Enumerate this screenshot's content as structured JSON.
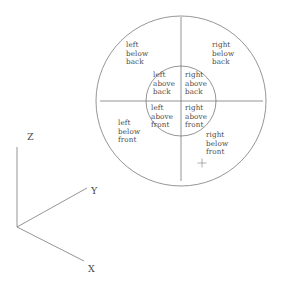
{
  "figure": {
    "background_color": "#ffffff",
    "stroke_color": "#7a7a7a",
    "text_color": "#4a4a4a"
  },
  "geometry": {
    "center_x": 181,
    "center_y": 101,
    "outer_radius": 85,
    "inner_radius": 35,
    "horizontal_axis": {
      "x1": 100,
      "y1": 101,
      "x2": 263,
      "y2": 101
    },
    "vertical_axis": {
      "x1": 181,
      "y1": 17,
      "x2": 181,
      "y2": 181
    },
    "marker_plus": {
      "x": 202,
      "y": 163,
      "size": 9
    }
  },
  "regions": [
    {
      "id": "outer-upper-left",
      "name": "left-below-back",
      "lines": [
        "left",
        "below",
        "back"
      ],
      "x": 126,
      "y": 41
    },
    {
      "id": "outer-upper-right",
      "name": "right-below-back",
      "lines": [
        "right",
        "below",
        "back"
      ],
      "x": 212,
      "y": 41
    },
    {
      "id": "inner-upper-left",
      "name": "left-above-back",
      "lines": [
        "left",
        "above",
        "back"
      ],
      "x": 153,
      "y": 71
    },
    {
      "id": "inner-upper-right",
      "name": "right-above-back",
      "lines": [
        "right",
        "above",
        "back"
      ],
      "x": 185,
      "y": 71
    },
    {
      "id": "inner-lower-left",
      "name": "left-above-front",
      "lines": [
        "left",
        "above",
        "front"
      ],
      "x": 151,
      "y": 104
    },
    {
      "id": "inner-lower-right",
      "name": "right-above-front",
      "lines": [
        "right",
        "above",
        "front"
      ],
      "x": 185,
      "y": 104
    },
    {
      "id": "outer-lower-left",
      "name": "left-below-front",
      "lines": [
        "left",
        "below",
        "front"
      ],
      "x": 118,
      "y": 119
    },
    {
      "id": "outer-lower-right",
      "name": "right-below-front",
      "lines": [
        "right",
        "below",
        "front"
      ],
      "x": 206,
      "y": 131
    }
  ],
  "axes": {
    "origin": {
      "x": 17,
      "y": 227
    },
    "items": [
      {
        "id": "axis-z",
        "label": "Z",
        "line": {
          "x1": 17,
          "y1": 227,
          "x2": 17,
          "y2": 147
        },
        "label_x": 27,
        "label_y": 132
      },
      {
        "id": "axis-y",
        "label": "Y",
        "line": {
          "x1": 17,
          "y1": 227,
          "x2": 87,
          "y2": 188
        },
        "label_x": 91,
        "label_y": 186
      },
      {
        "id": "axis-x",
        "label": "X",
        "line": {
          "x1": 17,
          "y1": 227,
          "x2": 84,
          "y2": 261
        },
        "label_x": 88,
        "label_y": 264
      }
    ]
  }
}
